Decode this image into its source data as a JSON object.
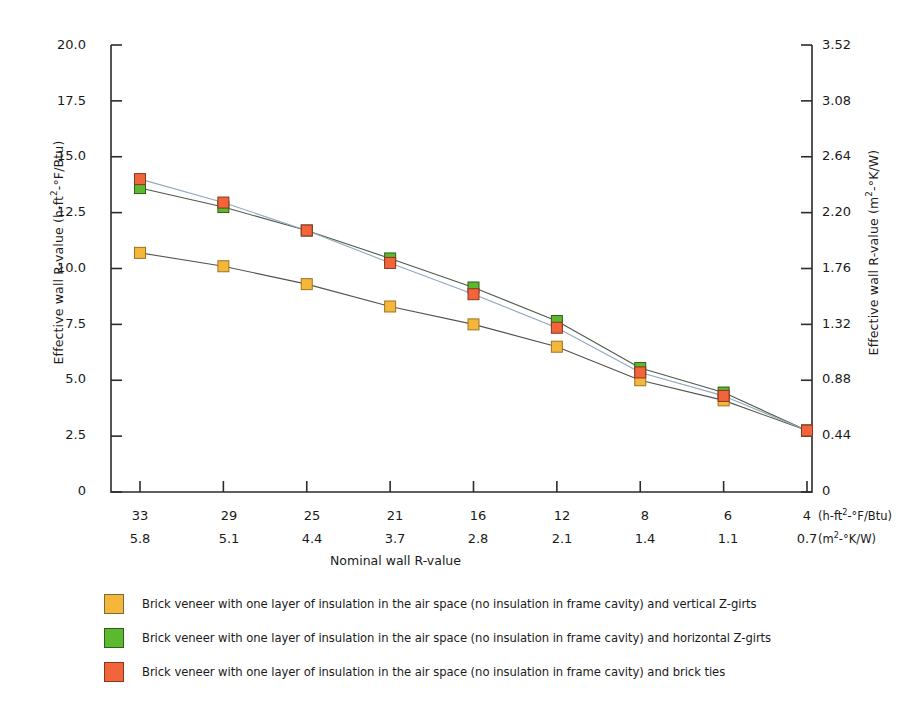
{
  "chart_data": {
    "type": "line",
    "title": "",
    "xlabel": "Nominal wall R-value",
    "ylabel": "Effective wall R-value (h-ft2-°F/Btu)",
    "ylabel_right": "Effective wall R-value (m2-°K/W)",
    "categories": [
      "33",
      "29",
      "25",
      "21",
      "16",
      "12",
      "8",
      "6",
      "4"
    ],
    "categories_metric": [
      "5.8",
      "5.1",
      "4.4",
      "3.7",
      "2.8",
      "2.1",
      "1.4",
      "1.1",
      "0.7"
    ],
    "x_unit_imperial": "(h-ft2-°F/Btu)",
    "x_unit_metric": "(m2-°K/W)",
    "yticks": [
      "0",
      "2.5",
      "5.0",
      "7.5",
      "10.0",
      "12.5",
      "15.0",
      "17.5",
      "20.0"
    ],
    "yticks_right": [
      "0",
      "0.44",
      "0.88",
      "1.32",
      "1.76",
      "2.20",
      "2.64",
      "3.08",
      "3.52"
    ],
    "ylim": [
      0,
      20
    ],
    "ylim_right": [
      0,
      3.52
    ],
    "grid": false,
    "legend_position": "below",
    "series": [
      {
        "name": "Brick veneer with one layer of insulation in the air space (no insulation in frame cavity) and vertical Z-girts",
        "color": "#F5B63C",
        "values": [
          10.7,
          10.1,
          9.3,
          8.3,
          7.5,
          6.5,
          5.0,
          4.1,
          2.75
        ]
      },
      {
        "name": "Brick veneer with one layer of insulation in the air space (no insulation in frame cavity) and horizontal Z-girts",
        "color": "#5CB82E",
        "values": [
          13.6,
          12.75,
          11.7,
          10.45,
          9.15,
          7.65,
          5.55,
          4.45,
          2.75
        ]
      },
      {
        "name": "Brick veneer with one layer of insulation in the air space (no insulation in frame cavity) and brick ties",
        "color": "#F2643A",
        "values": [
          14.0,
          12.95,
          11.7,
          10.25,
          8.85,
          7.35,
          5.35,
          4.3,
          2.75
        ]
      }
    ]
  }
}
